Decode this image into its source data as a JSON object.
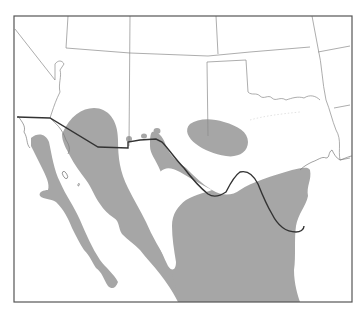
{
  "map": {
    "type": "species range map",
    "region": "Southwestern United States and northern Mexico",
    "colors": {
      "background": "#ffffff",
      "range_fill": "#a6a6a6",
      "frame": "#555555",
      "state_lines": "#8a8a8a",
      "international_border": "#333333"
    },
    "range_areas": [
      {
        "name": "baja-california-peninsula",
        "description": "Shaded range along Baja California peninsula"
      },
      {
        "name": "sonora-sinaloa-coast",
        "description": "Shaded band from southern Arizona along Sonora/Sinaloa coastal plain"
      },
      {
        "name": "chihuahua-texas-main",
        "description": "Large shaded range from Chihuahua/west Texas south through eastern Mexico to Gulf coast"
      },
      {
        "name": "new-mexico-texas-outlier",
        "description": "Isolated shaded patch in southeastern New Mexico / west Texas"
      },
      {
        "name": "southwest-new-mexico-dots",
        "description": "Two small isolated dots near the New Mexico bootheel"
      }
    ]
  }
}
